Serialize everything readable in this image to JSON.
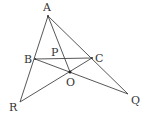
{
  "diagram": {
    "type": "geometry",
    "points": {
      "A": {
        "label": "A",
        "x": 48,
        "y": 16
      },
      "B": {
        "label": "B",
        "x": 35,
        "y": 59
      },
      "C": {
        "label": "C",
        "x": 92,
        "y": 58
      },
      "O": {
        "label": "O",
        "x": 70,
        "y": 72
      },
      "P": {
        "label": "P",
        "x": 61,
        "y": 58
      },
      "R": {
        "label": "R",
        "x": 20,
        "y": 102
      },
      "Q": {
        "label": "Q",
        "x": 128,
        "y": 94
      }
    },
    "segments": [
      [
        "A",
        "R"
      ],
      [
        "A",
        "Q"
      ],
      [
        "A",
        "O"
      ],
      [
        "B",
        "C"
      ],
      [
        "B",
        "Q"
      ],
      [
        "C",
        "R"
      ]
    ],
    "colors": {
      "line": "#444444",
      "text": "#333333",
      "background": "#ffffff"
    }
  }
}
